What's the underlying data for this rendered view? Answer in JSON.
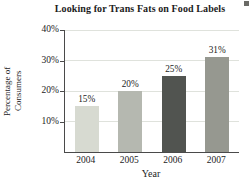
{
  "chart_data": {
    "type": "bar",
    "title": "Looking for Trans Fats on Food Labels",
    "categories": [
      "2004",
      "2005",
      "2006",
      "2007"
    ],
    "values": [
      15,
      20,
      25,
      31
    ],
    "value_labels": [
      "15%",
      "20%",
      "25%",
      "31%"
    ],
    "xlabel": "Year",
    "ylabel_lines": [
      "Percentage of",
      "Consumers"
    ],
    "ylim": [
      0,
      40
    ],
    "yticks": [
      10,
      20,
      30,
      40
    ],
    "ytick_labels": [
      "10%",
      "20%",
      "30%",
      "40%"
    ],
    "grid": true,
    "legend": "none",
    "bar_colors": [
      "#d7dad1",
      "#b5b8b0",
      "#515450",
      "#969890"
    ],
    "gridline_color": "#dfe2dc",
    "axis_color": "#4a4a4a"
  }
}
